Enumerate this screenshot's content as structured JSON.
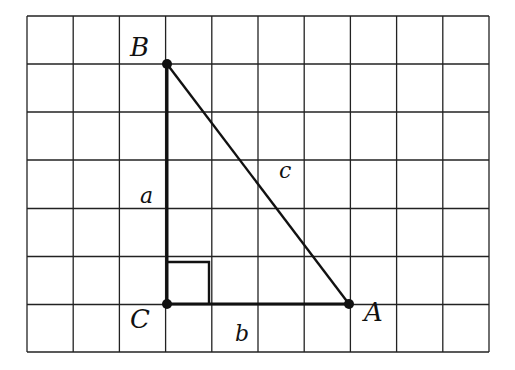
{
  "diagram": {
    "type": "right-triangle-on-grid",
    "grid": {
      "columns": 10,
      "rows": 7,
      "x_lines": [
        27,
        73.2,
        119.4,
        165.6,
        211.8,
        258,
        304.2,
        350.4,
        396.6,
        442.8,
        489
      ],
      "y_lines": [
        16,
        64,
        112,
        160,
        208.5,
        256.5,
        304.5,
        352
      ],
      "line_color": "#222222"
    },
    "vertices": [
      {
        "name": "B",
        "x": 167,
        "y": 64,
        "label_x": 130,
        "label_y": 56
      },
      {
        "name": "C",
        "x": 167,
        "y": 304,
        "label_x": 130,
        "label_y": 328
      },
      {
        "name": "A",
        "x": 349,
        "y": 304,
        "label_x": 364,
        "label_y": 321
      }
    ],
    "sides": [
      {
        "name": "a",
        "from": "C",
        "to": "B",
        "label_x": 140,
        "label_y": 203
      },
      {
        "name": "b",
        "from": "C",
        "to": "A",
        "label_x": 235,
        "label_y": 341
      },
      {
        "name": "c",
        "from": "B",
        "to": "A",
        "label_x": 279,
        "label_y": 178
      }
    ],
    "right_angle_marker": {
      "at": "C",
      "size": 42
    }
  }
}
